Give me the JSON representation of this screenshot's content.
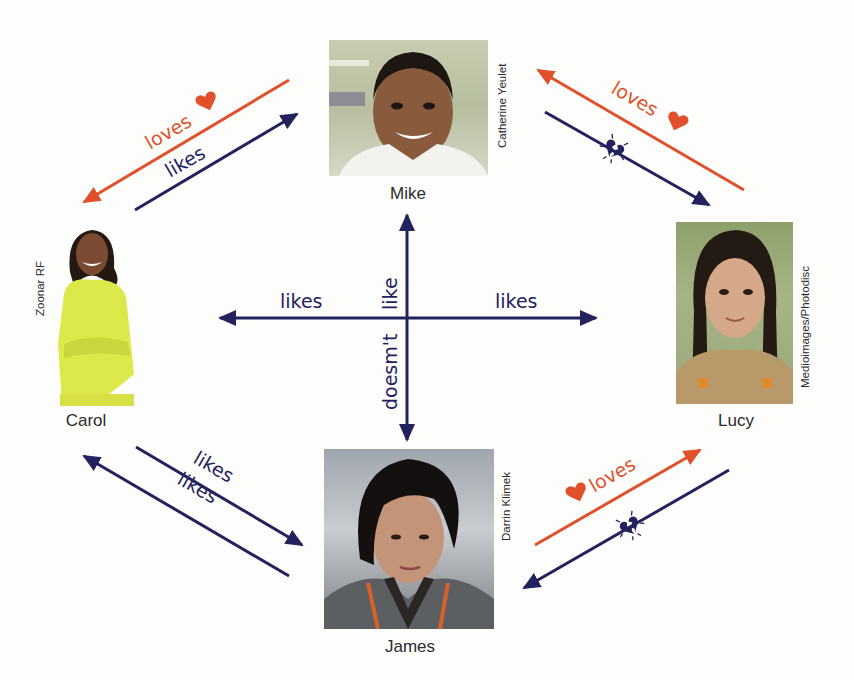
{
  "colors": {
    "navy": "#23215e",
    "orange": "#e0502a",
    "background": "#fdfdfc"
  },
  "people": {
    "mike": {
      "name": "Mike",
      "credit": "Catherine Yeulet"
    },
    "carol": {
      "name": "Carol",
      "credit": "Zoonar RF"
    },
    "lucy": {
      "name": "Lucy",
      "credit": "Medioimages/Photodisc"
    },
    "james": {
      "name": "James",
      "credit": "Darrin Klimek"
    }
  },
  "relations": {
    "mike_carol_orange": {
      "label": "loves",
      "from": "Mike",
      "to": "Carol",
      "icon": "heart-icon"
    },
    "carol_mike_navy": {
      "label": "likes",
      "from": "Carol",
      "to": "Mike"
    },
    "lucy_mike_orange": {
      "label": "loves",
      "from": "Lucy",
      "to": "Mike",
      "icon": "heart-icon"
    },
    "mike_lucy_navy": {
      "label": "",
      "from": "Mike",
      "to": "Lucy",
      "icon": "broken-heart-icon"
    },
    "center_left": {
      "label": "likes",
      "to": "Carol"
    },
    "center_right": {
      "label": "likes",
      "to": "Lucy"
    },
    "center_vertical_top": {
      "label": "like"
    },
    "center_vertical_bottom": {
      "label": "doesm't"
    },
    "carol_james_navy": {
      "label": "likes",
      "from": "Carol",
      "to": "James"
    },
    "james_carol_navy": {
      "label": "likes",
      "from": "James",
      "to": "Carol"
    },
    "james_lucy_orange": {
      "label": "loves",
      "from": "James",
      "to": "Lucy",
      "icon": "heart-icon"
    },
    "lucy_james_navy": {
      "label": "",
      "from": "Lucy",
      "to": "James",
      "icon": "broken-heart-icon"
    }
  }
}
